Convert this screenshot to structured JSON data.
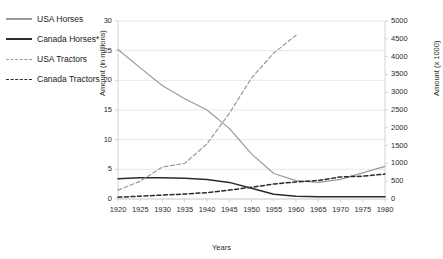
{
  "chart_data": {
    "type": "line",
    "title": "",
    "xlabel": "Years",
    "ylabel": "Amount (in millions)",
    "ylabel_right": "Amount (x 1000)",
    "grid": true,
    "legend_position": "top-left",
    "x": [
      1920,
      1925,
      1930,
      1935,
      1940,
      1945,
      1950,
      1955,
      1960,
      1965,
      1970,
      1975,
      1980
    ],
    "xticks": [
      "1920",
      "1925",
      "1930",
      "1935",
      "1940",
      "1945",
      "1950",
      "1955",
      "1960",
      "1965",
      "1970",
      "1975",
      "1980"
    ],
    "xlim": [
      1920,
      1980
    ],
    "ylim": [
      0,
      30
    ],
    "yticks": [
      "0",
      "5",
      "10",
      "15",
      "20",
      "25",
      "30"
    ],
    "ylim_right": [
      0,
      5000
    ],
    "yticks_right": [
      "0",
      "500",
      "1000",
      "1500",
      "2000",
      "2500",
      "3000",
      "3500",
      "4000",
      "4500",
      "5000"
    ],
    "series": [
      {
        "name": "USA Horses",
        "axis": "left",
        "style": "solid",
        "color": "#9a9a9a",
        "unit": "millions",
        "values": [
          25.2,
          22.1,
          19.1,
          16.9,
          15.0,
          11.9,
          7.6,
          4.3,
          3.1,
          2.8,
          3.3,
          4.4,
          5.5
        ]
      },
      {
        "name": "Canada Horses*",
        "axis": "left",
        "style": "solid",
        "color": "#2b2b2b",
        "unit": "millions",
        "values": [
          3.4,
          3.6,
          3.6,
          3.5,
          3.3,
          2.8,
          1.8,
          0.8,
          0.45,
          0.4,
          0.4,
          0.4,
          0.4
        ]
      },
      {
        "name": "USA Tractors",
        "axis": "right",
        "style": "dashed",
        "color": "#9a9a9a",
        "unit": "x 1000",
        "values": [
          250,
          500,
          900,
          1000,
          1550,
          2400,
          3400,
          4100,
          4600,
          null,
          null,
          null,
          null
        ]
      },
      {
        "name": "Canada Tractors",
        "axis": "right",
        "style": "dashed",
        "color": "#2b2b2b",
        "unit": "x 1000",
        "values": [
          50,
          80,
          110,
          140,
          180,
          250,
          330,
          420,
          480,
          520,
          620,
          640,
          700
        ]
      }
    ]
  },
  "legend": {
    "items": [
      {
        "label": "USA Horses"
      },
      {
        "label": "Canada Horses*"
      },
      {
        "label": "USA Tractors"
      },
      {
        "label": "Canada Tractors"
      }
    ]
  }
}
